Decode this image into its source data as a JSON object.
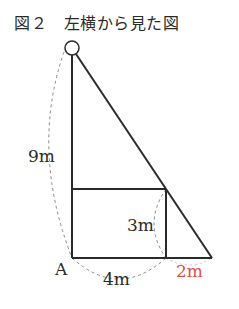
{
  "figure": {
    "title": "図２　左横から見た図",
    "labels": {
      "height_total": "9m",
      "rect_height": "3m",
      "point_a": "A",
      "rect_width": "4m",
      "shadow_extra": "2m"
    },
    "colors": {
      "line": "#2a2a2a",
      "dashed": "#888888",
      "highlight": "#e0504a"
    }
  }
}
